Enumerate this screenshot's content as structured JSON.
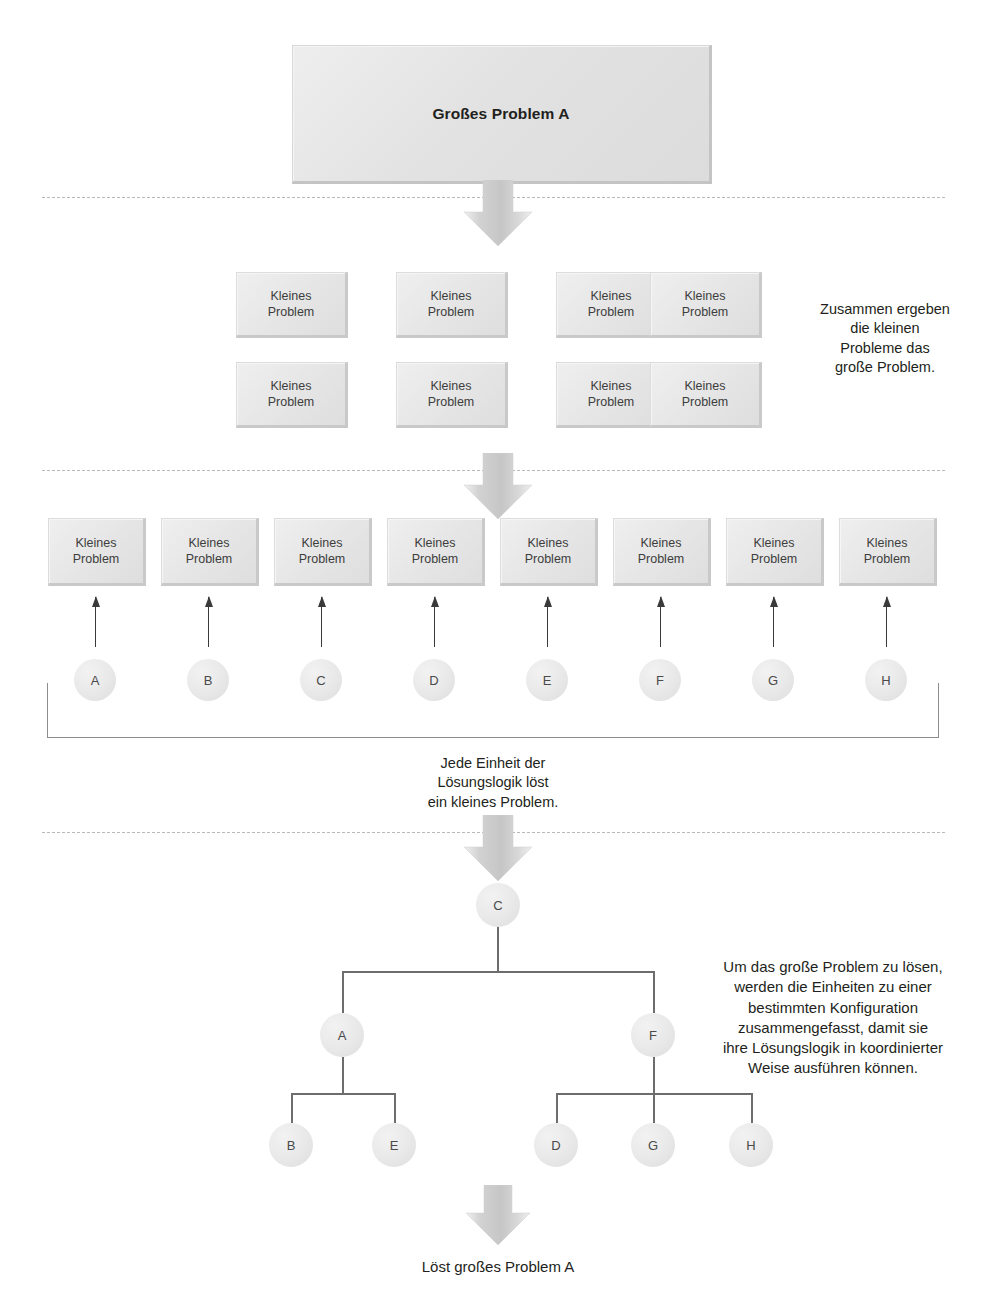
{
  "diagram": {
    "title_box": {
      "label": "Großes Problem A"
    },
    "small_problem_label_line1": "Kleines",
    "small_problem_label_line2": "Problem",
    "grid_boxes": [
      {
        "label1": "Kleines",
        "label2": "Problem"
      },
      {
        "label1": "Kleines",
        "label2": "Problem"
      },
      {
        "label1": "Kleines",
        "label2": "Problem"
      },
      {
        "label1": "Kleines",
        "label2": "Problem"
      },
      {
        "label1": "Kleines",
        "label2": "Problem"
      },
      {
        "label1": "Kleines",
        "label2": "Problem"
      },
      {
        "label1": "Kleines",
        "label2": "Problem"
      },
      {
        "label1": "Kleines",
        "label2": "Problem"
      }
    ],
    "row_boxes": [
      {
        "label1": "Kleines",
        "label2": "Problem"
      },
      {
        "label1": "Kleines",
        "label2": "Problem"
      },
      {
        "label1": "Kleines",
        "label2": "Problem"
      },
      {
        "label1": "Kleines",
        "label2": "Problem"
      },
      {
        "label1": "Kleines",
        "label2": "Problem"
      },
      {
        "label1": "Kleines",
        "label2": "Problem"
      },
      {
        "label1": "Kleines",
        "label2": "Problem"
      },
      {
        "label1": "Kleines",
        "label2": "Problem"
      }
    ],
    "units": [
      {
        "id": "A"
      },
      {
        "id": "B"
      },
      {
        "id": "C"
      },
      {
        "id": "D"
      },
      {
        "id": "E"
      },
      {
        "id": "F"
      },
      {
        "id": "G"
      },
      {
        "id": "H"
      }
    ],
    "captions": {
      "right_top": "Zusammen ergeben\ndie kleinen\nProbleme das\ngroße Problem.",
      "bracket": "Jede Einheit der\nLösungslogik löst\nein kleines Problem.",
      "right_tree": "Um das große Problem zu lösen,\nwerden die Einheiten zu einer\nbestimmten Konfiguration\nzusammengefasst, damit sie\nihre Lösungslogik in koordinierter\nWeise ausführen können.",
      "final": "Löst großes Problem A"
    },
    "tree": {
      "root": {
        "id": "C"
      },
      "level2": [
        {
          "id": "A"
        },
        {
          "id": "F"
        }
      ],
      "level3_left": [
        {
          "id": "B"
        },
        {
          "id": "E"
        }
      ],
      "level3_right": [
        {
          "id": "D"
        },
        {
          "id": "G"
        },
        {
          "id": "H"
        }
      ]
    },
    "colors": {
      "box_fill": "#e6e6e6",
      "box_edge": "#c9c9c9",
      "arrow_fill": "#cfcfcf",
      "line": "#6d6d6d",
      "dashed": "#b9b9b9",
      "text": "#231f20"
    }
  }
}
